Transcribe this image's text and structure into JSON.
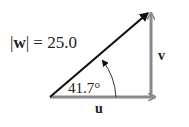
{
  "diagram": {
    "magnitude_label": "|w| = 25.0",
    "magnitude_prefix": "|",
    "magnitude_var": "w",
    "magnitude_suffix": "| = 25.0",
    "angle_label": "41.7°",
    "horizontal_label": "u",
    "vertical_label": "v",
    "colors": {
      "resultant": "#111111",
      "components": "#8a8a8a",
      "text": "#222222"
    }
  }
}
